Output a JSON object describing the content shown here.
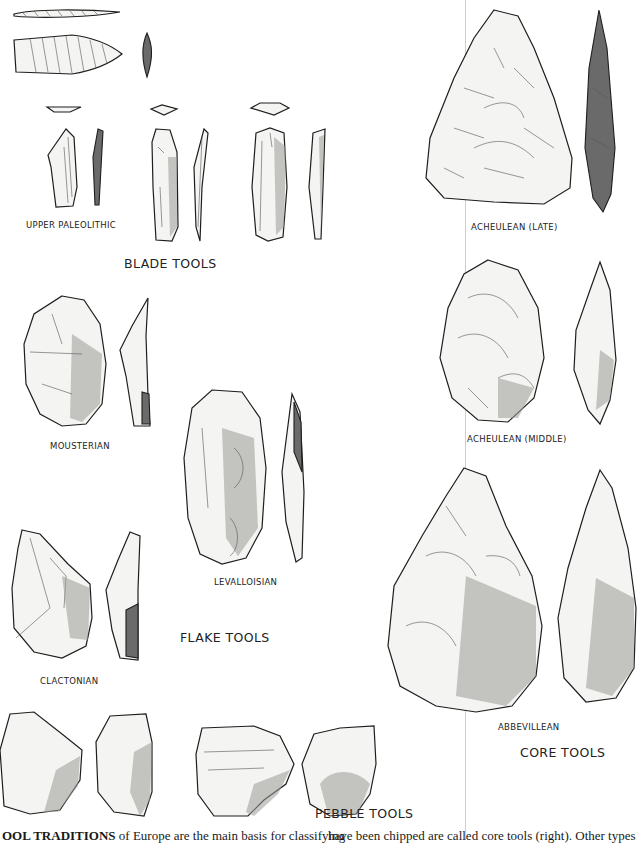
{
  "figure": {
    "groups": [
      {
        "id": "blade",
        "heading": "BLADE TOOLS",
        "items": [
          {
            "label": "UPPER PALEOLITHIC"
          }
        ]
      },
      {
        "id": "flake",
        "heading": "FLAKE TOOLS",
        "items": [
          {
            "label": "MOUSTERIAN"
          },
          {
            "label": "LEVALLOISIAN"
          },
          {
            "label": "CLACTONIAN"
          }
        ]
      },
      {
        "id": "core",
        "heading": "CORE TOOLS",
        "items": [
          {
            "label": "ACHEULEAN (LATE)"
          },
          {
            "label": "ACHEULEAN (MIDDLE)"
          },
          {
            "label": "ABBEVILLEAN"
          }
        ]
      },
      {
        "id": "pebble",
        "heading": "PEBBLE TOOLS",
        "items": []
      }
    ]
  },
  "caption": {
    "left_bold": "OOL TRADITIONS",
    "left_rest": " of Europe are the main basis for classifying",
    "right": "have been chipped are called core tools (right). Other types"
  }
}
